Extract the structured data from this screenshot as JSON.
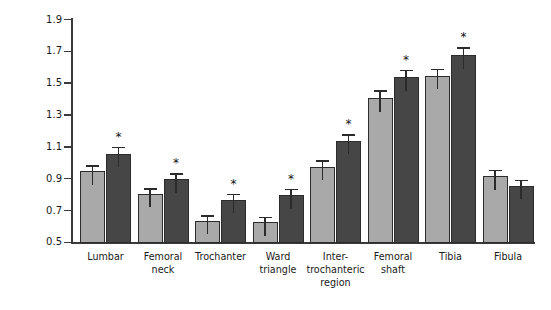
{
  "chart_data": {
    "type": "bar",
    "title": "",
    "xlabel": "",
    "ylabel": "Bone mineral density (g·cm",
    "ylabel_sup": "-2",
    "ylabel_suffix": ")",
    "ylim": [
      0.5,
      1.9
    ],
    "ytick_step": 0.2,
    "yticks": [
      "1.9",
      "1.7",
      "1.5",
      "1.3",
      "1.1",
      "0.9",
      "0.7",
      "0.5"
    ],
    "ytick_values": [
      1.9,
      1.7,
      1.5,
      1.3,
      1.1,
      0.9,
      0.7,
      0.5
    ],
    "grid": false,
    "legend": "none",
    "categories": [
      "Lumbar",
      "Femoral neck",
      "Trochanter",
      "Ward triangle",
      "Inter-trochanteric region",
      "Femoral shaft",
      "Tibia",
      "Fibula"
    ],
    "category_label_lines": [
      [
        "Lumbar"
      ],
      [
        "Femoral",
        "neck"
      ],
      [
        "Trochanter"
      ],
      [
        "Ward",
        "triangle"
      ],
      [
        "Inter-",
        "trochanteric",
        "region"
      ],
      [
        "Femoral",
        "shaft"
      ],
      [
        "Tibia"
      ],
      [
        "Fibula"
      ]
    ],
    "series": [
      {
        "name": "light",
        "color": "#a9a9a9",
        "values": [
          0.95,
          0.81,
          0.64,
          0.63,
          0.98,
          1.41,
          1.55,
          0.92
        ],
        "errors": [
          0.035,
          0.03,
          0.03,
          0.03,
          0.035,
          0.045,
          0.04,
          0.035
        ],
        "significant": [
          false,
          false,
          false,
          false,
          false,
          false,
          false,
          false
        ]
      },
      {
        "name": "dark",
        "color": "#464646",
        "values": [
          1.06,
          0.9,
          0.77,
          0.8,
          1.14,
          1.54,
          1.68,
          0.86
        ],
        "errors": [
          0.04,
          0.035,
          0.035,
          0.035,
          0.04,
          0.045,
          0.045,
          0.035
        ],
        "significant": [
          true,
          true,
          true,
          true,
          true,
          true,
          true,
          false
        ]
      }
    ],
    "significance_marker": "*"
  },
  "axis": {
    "line_color": "#3a3a3a"
  }
}
